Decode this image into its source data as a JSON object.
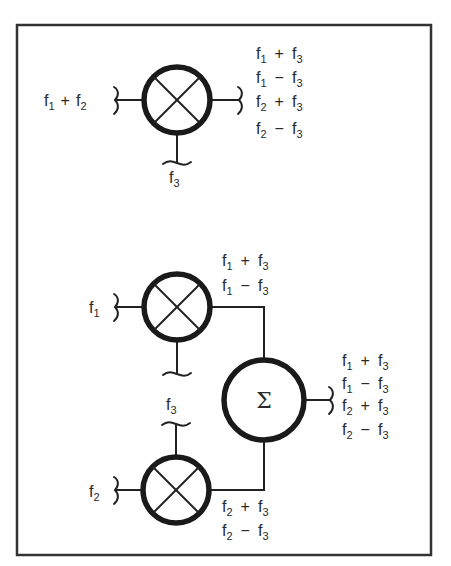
{
  "diagram": {
    "frame": {
      "x": 16,
      "y": 24,
      "width": 415,
      "height": 531,
      "stroke": "#333333"
    },
    "top_section": {
      "mixer": {
        "id": "mixer-top",
        "symbol": "multiply",
        "cx": 177,
        "cy": 100,
        "r": 33
      },
      "input_left": {
        "label_main": "f",
        "label_sub": "1",
        "op": "+",
        "label_main2": "f",
        "label_sub2": "2",
        "text": "f1 + f2"
      },
      "input_bottom": {
        "label_main": "f",
        "label_sub": "3",
        "text": "f3"
      },
      "outputs": [
        {
          "a": "1",
          "op": "+",
          "b": "3",
          "text": "f1 + f3"
        },
        {
          "a": "1",
          "op": "−",
          "b": "3",
          "text": "f1 − f3"
        },
        {
          "a": "2",
          "op": "+",
          "b": "3",
          "text": "f2 + f3"
        },
        {
          "a": "2",
          "op": "−",
          "b": "3",
          "text": "f2 − f3"
        }
      ]
    },
    "bottom_section": {
      "mixer_upper": {
        "id": "mixer-f1",
        "symbol": "multiply",
        "cx": 177,
        "cy": 307,
        "r": 33,
        "input_left": {
          "label_main": "f",
          "label_sub": "1",
          "text": "f1"
        },
        "outputs": [
          {
            "a": "1",
            "op": "+",
            "b": "3",
            "text": "f1 + f3"
          },
          {
            "a": "1",
            "op": "−",
            "b": "3",
            "text": "f1 − f3"
          }
        ]
      },
      "mixer_lower": {
        "id": "mixer-f2",
        "symbol": "multiply",
        "cx": 176,
        "cy": 490,
        "r": 33,
        "input_left": {
          "label_main": "f",
          "label_sub": "2",
          "text": "f2"
        },
        "input_top": {
          "label_main": "f",
          "label_sub": "3",
          "text": "f3"
        },
        "outputs": [
          {
            "a": "2",
            "op": "+",
            "b": "3",
            "text": "f2 + f3"
          },
          {
            "a": "2",
            "op": "−",
            "b": "3",
            "text": "f2 − f3"
          }
        ]
      },
      "summer": {
        "id": "summer",
        "symbol": "Σ",
        "cx": 264,
        "cy": 400,
        "r": 40,
        "outputs": [
          {
            "a": "1",
            "op": "+",
            "b": "3",
            "text": "f1 + f3"
          },
          {
            "a": "1",
            "op": "−",
            "b": "3",
            "text": "f1 − f3"
          },
          {
            "a": "2",
            "op": "+",
            "b": "3",
            "text": "f2 + f3"
          },
          {
            "a": "2",
            "op": "−",
            "b": "3",
            "text": "f2 − f3"
          }
        ]
      }
    },
    "colors": {
      "line": "#222222",
      "text": "#2a2a2a",
      "background": "#ffffff"
    }
  }
}
